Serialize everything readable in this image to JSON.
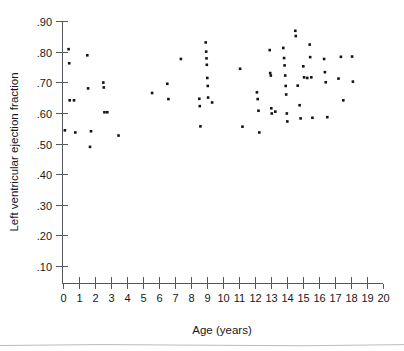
{
  "chart_data": {
    "type": "scatter",
    "title": "",
    "xlabel": "Age (years)",
    "ylabel": "Left ventricular ejection fraction",
    "xlim": [
      0,
      20
    ],
    "ylim": [
      0.0,
      0.9
    ],
    "grid": false,
    "legend": null,
    "xticks": [
      0,
      1,
      2,
      3,
      4,
      5,
      6,
      7,
      8,
      9,
      10,
      11,
      12,
      13,
      14,
      15,
      16,
      17,
      18,
      19,
      20
    ],
    "xticklabels": [
      "0",
      "1",
      "2",
      "3",
      "4",
      "5",
      "6",
      "7",
      "8",
      "9",
      "10",
      "11",
      "12",
      "13",
      "14",
      "15",
      "16",
      "17",
      "18",
      "19",
      "20"
    ],
    "yticks": [
      0.1,
      0.2,
      0.3,
      0.4,
      0.5,
      0.6,
      0.7,
      0.8,
      0.9
    ],
    "yticklabels": [
      ".10",
      ".20",
      ".30",
      ".40",
      ".50",
      ".60",
      ".70",
      ".80",
      ".90"
    ],
    "marker": "square",
    "marker_color": "#111316",
    "marker_size_px": 2.6,
    "n_points": 79,
    "points": [
      {
        "x": 0.15,
        "y": 0.543
      },
      {
        "x": 0.38,
        "y": 0.808
      },
      {
        "x": 0.42,
        "y": 0.762
      },
      {
        "x": 0.45,
        "y": 0.641
      },
      {
        "x": 0.72,
        "y": 0.641
      },
      {
        "x": 0.8,
        "y": 0.536
      },
      {
        "x": 1.55,
        "y": 0.788
      },
      {
        "x": 1.6,
        "y": 0.68
      },
      {
        "x": 1.72,
        "y": 0.489
      },
      {
        "x": 1.78,
        "y": 0.54
      },
      {
        "x": 2.55,
        "y": 0.699
      },
      {
        "x": 2.58,
        "y": 0.683
      },
      {
        "x": 2.62,
        "y": 0.602
      },
      {
        "x": 2.8,
        "y": 0.602
      },
      {
        "x": 3.5,
        "y": 0.526
      },
      {
        "x": 5.6,
        "y": 0.665
      },
      {
        "x": 6.55,
        "y": 0.695
      },
      {
        "x": 6.62,
        "y": 0.645
      },
      {
        "x": 7.4,
        "y": 0.776
      },
      {
        "x": 8.55,
        "y": 0.646
      },
      {
        "x": 8.58,
        "y": 0.622
      },
      {
        "x": 8.62,
        "y": 0.556
      },
      {
        "x": 8.95,
        "y": 0.83
      },
      {
        "x": 8.98,
        "y": 0.8
      },
      {
        "x": 9.0,
        "y": 0.778
      },
      {
        "x": 9.02,
        "y": 0.757
      },
      {
        "x": 9.05,
        "y": 0.714
      },
      {
        "x": 9.08,
        "y": 0.688
      },
      {
        "x": 9.1,
        "y": 0.65
      },
      {
        "x": 9.35,
        "y": 0.634
      },
      {
        "x": 11.1,
        "y": 0.744
      },
      {
        "x": 11.25,
        "y": 0.555
      },
      {
        "x": 12.15,
        "y": 0.667
      },
      {
        "x": 12.2,
        "y": 0.645
      },
      {
        "x": 12.25,
        "y": 0.607
      },
      {
        "x": 12.3,
        "y": 0.536
      },
      {
        "x": 12.95,
        "y": 0.805
      },
      {
        "x": 12.98,
        "y": 0.73
      },
      {
        "x": 13.02,
        "y": 0.722
      },
      {
        "x": 13.05,
        "y": 0.615
      },
      {
        "x": 13.08,
        "y": 0.598
      },
      {
        "x": 13.3,
        "y": 0.604
      },
      {
        "x": 13.8,
        "y": 0.812
      },
      {
        "x": 13.85,
        "y": 0.779
      },
      {
        "x": 13.88,
        "y": 0.755
      },
      {
        "x": 13.92,
        "y": 0.722
      },
      {
        "x": 13.95,
        "y": 0.688
      },
      {
        "x": 13.98,
        "y": 0.66
      },
      {
        "x": 14.02,
        "y": 0.598
      },
      {
        "x": 14.05,
        "y": 0.572
      },
      {
        "x": 14.55,
        "y": 0.868
      },
      {
        "x": 14.58,
        "y": 0.851
      },
      {
        "x": 14.7,
        "y": 0.689
      },
      {
        "x": 14.82,
        "y": 0.625
      },
      {
        "x": 14.88,
        "y": 0.582
      },
      {
        "x": 15.05,
        "y": 0.752
      },
      {
        "x": 15.1,
        "y": 0.716
      },
      {
        "x": 15.3,
        "y": 0.714
      },
      {
        "x": 15.45,
        "y": 0.823
      },
      {
        "x": 15.48,
        "y": 0.782
      },
      {
        "x": 15.55,
        "y": 0.716
      },
      {
        "x": 15.62,
        "y": 0.584
      },
      {
        "x": 16.35,
        "y": 0.776
      },
      {
        "x": 16.4,
        "y": 0.733
      },
      {
        "x": 16.45,
        "y": 0.7
      },
      {
        "x": 16.55,
        "y": 0.586
      },
      {
        "x": 17.25,
        "y": 0.712
      },
      {
        "x": 17.4,
        "y": 0.783
      },
      {
        "x": 17.55,
        "y": 0.641
      },
      {
        "x": 18.1,
        "y": 0.784
      },
      {
        "x": 18.15,
        "y": 0.702
      }
    ]
  },
  "axes": {
    "x_title": "Age (years)",
    "y_title": "Left ventricular ejection fraction"
  }
}
